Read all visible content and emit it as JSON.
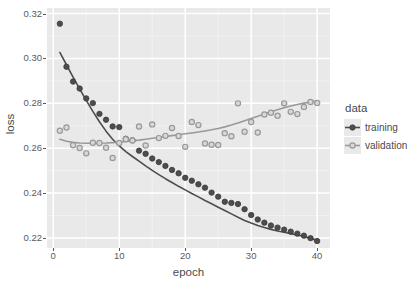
{
  "chart_data": {
    "type": "scatter",
    "title": "",
    "xlabel": "epoch",
    "ylabel": "loss",
    "xlim": [
      -0.95,
      41.95
    ],
    "ylim": [
      0.2155,
      0.3225
    ],
    "xticks": [
      0,
      10,
      20,
      30,
      40
    ],
    "xtick_labels": [
      "0",
      "10",
      "20",
      "30",
      "40"
    ],
    "yticks": [
      0.22,
      0.24,
      0.26,
      0.28,
      0.3,
      0.32
    ],
    "ytick_labels": [
      "0.22",
      "0.24",
      "0.26",
      "0.28",
      "0.30",
      "0.32"
    ],
    "grid": true,
    "grid_color": "#ffffff",
    "panel_background": "#e9e9e9",
    "legend": {
      "title": "data",
      "position": "right",
      "entries": [
        {
          "name": "training",
          "color": "#4d4d4d",
          "marker": "filled-circle"
        },
        {
          "name": "validation",
          "color": "#999999",
          "marker": "open-circle"
        }
      ]
    },
    "x": [
      1,
      2,
      3,
      4,
      5,
      6,
      7,
      8,
      9,
      10,
      11,
      12,
      13,
      14,
      15,
      16,
      17,
      18,
      19,
      20,
      21,
      22,
      23,
      24,
      25,
      26,
      27,
      28,
      29,
      30,
      31,
      32,
      33,
      34,
      35,
      36,
      37,
      38,
      39,
      40
    ],
    "series": [
      {
        "name": "training",
        "color": "#4d4d4d",
        "marker": "filled-circle",
        "has_smooth_line": true,
        "values": [
          0.3155,
          0.2963,
          0.2897,
          0.2866,
          0.2822,
          0.2801,
          0.2753,
          0.2727,
          0.2697,
          0.2694,
          0.2642,
          0.2635,
          0.2589,
          0.2575,
          0.2554,
          0.2538,
          0.2521,
          0.2503,
          0.2488,
          0.2468,
          0.2455,
          0.2439,
          0.2424,
          0.2402,
          0.2384,
          0.2361,
          0.2356,
          0.2351,
          0.2328,
          0.2302,
          0.2282,
          0.2268,
          0.2255,
          0.2246,
          0.2237,
          0.2228,
          0.2219,
          0.221,
          0.2199,
          0.2186
        ],
        "smooth": [
          0.3027,
          0.2972,
          0.2917,
          0.2864,
          0.2813,
          0.2764,
          0.2718,
          0.2676,
          0.264,
          0.261,
          0.2585,
          0.2563,
          0.2542,
          0.2521,
          0.2501,
          0.2482,
          0.2464,
          0.2447,
          0.243,
          0.2414,
          0.2398,
          0.2383,
          0.2367,
          0.2352,
          0.2337,
          0.2322,
          0.2307,
          0.2292,
          0.2278,
          0.2266,
          0.2255,
          0.2246,
          0.2238,
          0.2231,
          0.2225,
          0.2219,
          0.2213,
          0.2206,
          0.2198,
          0.2189
        ]
      },
      {
        "name": "validation",
        "color": "#999999",
        "marker": "open-circle",
        "has_smooth_line": true,
        "values": [
          0.2678,
          0.2692,
          0.2613,
          0.2601,
          0.2577,
          0.2624,
          0.2623,
          0.2602,
          0.2556,
          0.2623,
          0.264,
          0.2634,
          0.2697,
          0.2612,
          0.2706,
          0.2645,
          0.2655,
          0.269,
          0.2654,
          0.2606,
          0.2717,
          0.2703,
          0.2621,
          0.2615,
          0.2614,
          0.2667,
          0.2653,
          0.28,
          0.2673,
          0.2717,
          0.267,
          0.275,
          0.2758,
          0.2745,
          0.28,
          0.2762,
          0.2752,
          0.2784,
          0.2806,
          0.2802
        ],
        "smooth": [
          0.264,
          0.2631,
          0.2626,
          0.2623,
          0.2622,
          0.2622,
          0.2622,
          0.2623,
          0.2625,
          0.2627,
          0.263,
          0.2633,
          0.2636,
          0.264,
          0.2644,
          0.2648,
          0.2652,
          0.2656,
          0.266,
          0.2664,
          0.2668,
          0.2672,
          0.2677,
          0.2682,
          0.2688,
          0.2695,
          0.2703,
          0.2712,
          0.2722,
          0.2732,
          0.2742,
          0.2752,
          0.2762,
          0.2771,
          0.278,
          0.2788,
          0.2795,
          0.2801,
          0.2806,
          0.281
        ]
      }
    ]
  }
}
